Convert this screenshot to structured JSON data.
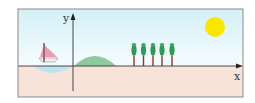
{
  "diagram": {
    "axes": {
      "x_label": "x",
      "y_label": "y"
    },
    "elements": [
      "sailboat",
      "water",
      "hill",
      "trees",
      "sun",
      "ground",
      "sky"
    ],
    "tree_count": 5,
    "colors": {
      "sky_top": "#d7f1f8",
      "sky_bottom": "#f4fbfd",
      "ground": "#f7e3d9",
      "water": "#bfe2ef",
      "hill": "#8ec9a0",
      "sun": "#fbe600",
      "sail": "#ec9bb1",
      "tree": "#2f9a55",
      "trunk": "#8b3a2a",
      "frame": "#8a8a8a",
      "axis": "#333333"
    }
  }
}
